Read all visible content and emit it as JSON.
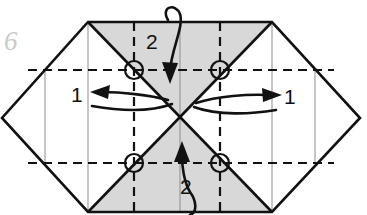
{
  "figure": {
    "number": "6",
    "kind": "origami-fold-diagram"
  },
  "colors": {
    "paper_white": "#ffffff",
    "shade_gray": "#d8d8d8",
    "line_black": "#111111",
    "thin_line_gray": "#8d8d8d",
    "figure_number_gray": "#c9c9c9",
    "background": "#ffffff"
  },
  "geometry": {
    "square": {
      "left": 88,
      "top": 22,
      "right": 272,
      "bottom": 212
    },
    "left_vertex": {
      "x": 2,
      "y": 118
    },
    "right_vertex": {
      "x": 360,
      "y": 118
    },
    "center": {
      "x": 180,
      "y": 117
    },
    "thin_vertical_lines_x": [
      45,
      88,
      180,
      272,
      315
    ],
    "dashed_horizontal_lines_y": [
      70,
      163
    ],
    "dashed_vertical_lines_x": [
      134,
      220
    ]
  },
  "shaded_regions": [
    {
      "name": "top-triangle",
      "points": "88,22 272,22 180,117"
    },
    {
      "name": "bottom-triangle",
      "points": "88,212 272,212 180,117"
    }
  ],
  "circles": [
    {
      "name": "crease-point-top-left",
      "cx": 134,
      "cy": 70,
      "r": 9
    },
    {
      "name": "crease-point-top-right",
      "cx": 220,
      "cy": 70,
      "r": 9
    },
    {
      "name": "crease-point-bottom-left",
      "cx": 134,
      "cy": 163,
      "r": 9
    },
    {
      "name": "crease-point-bottom-right",
      "cx": 220,
      "cy": 163,
      "r": 9
    }
  ],
  "labels": {
    "fold_left": "1",
    "fold_right": "1",
    "fold_top": "2",
    "fold_bottom": "2"
  },
  "arrows": [
    {
      "name": "fold-arrow-left",
      "label": "1",
      "direction": "left",
      "style": "valley-fold-curved"
    },
    {
      "name": "fold-arrow-right",
      "label": "1",
      "direction": "right",
      "style": "valley-fold-curved"
    },
    {
      "name": "fold-arrow-top",
      "label": "2",
      "direction": "down",
      "style": "fold-over-edge"
    },
    {
      "name": "fold-arrow-bottom",
      "label": "2",
      "direction": "up",
      "style": "fold-over-edge"
    }
  ]
}
